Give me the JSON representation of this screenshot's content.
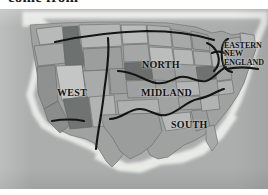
{
  "caption": {
    "clipped_line": "come from"
  },
  "figure": {
    "kind": "map",
    "background_color": "#a9acab",
    "boundary_line_color": "#111111",
    "ocean_color": "#b4b7b6",
    "land_base_color": "#9d9f9e"
  },
  "regions": [
    {
      "id": "west",
      "label": "WEST"
    },
    {
      "id": "north",
      "label": "NORTH"
    },
    {
      "id": "midland",
      "label": "MIDLAND"
    },
    {
      "id": "south",
      "label": "SOUTH"
    },
    {
      "id": "eastern-new-england",
      "label_lines": [
        "EASTERN",
        "NEW",
        "ENGLAND"
      ]
    }
  ],
  "eastern_new_england": {
    "line1": "EASTERN",
    "line2": "NEW",
    "line3": "ENGLAND"
  }
}
